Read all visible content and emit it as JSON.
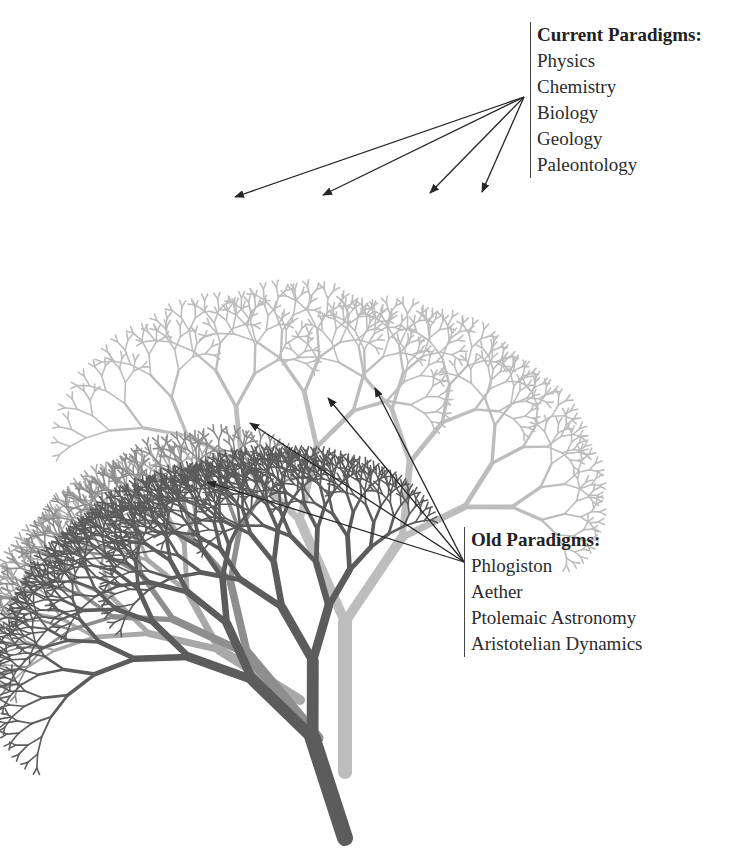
{
  "figure": {
    "width": 737,
    "height": 849,
    "background": "#ffffff"
  },
  "legends": {
    "current": {
      "title": "Current Paradigms:",
      "items": [
        "Physics",
        "Chemistry",
        "Biology",
        "Geology",
        "Paleontology"
      ],
      "arrow_origin": [
        524,
        97
      ],
      "arrow_targets": [
        [
          235,
          197
        ],
        [
          323,
          195
        ],
        [
          430,
          193
        ],
        [
          482,
          192
        ]
      ]
    },
    "old": {
      "title": "Old Paradigms:",
      "items": [
        "Phlogiston",
        "Aether",
        "Ptolemaic Astronomy",
        "Aristotelian Dynamics"
      ],
      "arrow_origin": [
        464,
        562
      ],
      "arrow_targets": [
        [
          207,
          482
        ],
        [
          250,
          423
        ],
        [
          328,
          398
        ],
        [
          375,
          388
        ]
      ]
    }
  },
  "colors": {
    "arrow": "#262626",
    "legend_rule": "#444444",
    "tree_dark": "#5c5c5c",
    "tree_mid": "#8e8e8e",
    "tree_soft": "#a9a9a9",
    "tree_light": "#bdbdbd"
  },
  "trees": [
    {
      "name": "light-tree",
      "color": "#bdbdbd",
      "x": 345,
      "y": 772,
      "angle": 0,
      "length": 150,
      "width": 14,
      "depth": 8,
      "left": -24,
      "right": 34,
      "ratio": 0.74,
      "taper": 0.7
    },
    {
      "name": "soft-tree",
      "color": "#a9a9a9",
      "x": 300,
      "y": 700,
      "angle": -58,
      "length": 95,
      "width": 10,
      "depth": 7,
      "left": -26,
      "right": 22,
      "ratio": 0.76,
      "taper": 0.7
    },
    {
      "name": "mid-tree",
      "color": "#8e8e8e",
      "x": 318,
      "y": 738,
      "angle": -40,
      "length": 110,
      "width": 11,
      "depth": 7,
      "left": -30,
      "right": 22,
      "ratio": 0.74,
      "taper": 0.7
    },
    {
      "name": "dark-tree",
      "color": "#5c5c5c",
      "x": 345,
      "y": 838,
      "angle": -18,
      "length": 105,
      "width": 16,
      "depth": 9,
      "left": -30,
      "right": 16,
      "ratio": 0.8,
      "taper": 0.74
    }
  ]
}
